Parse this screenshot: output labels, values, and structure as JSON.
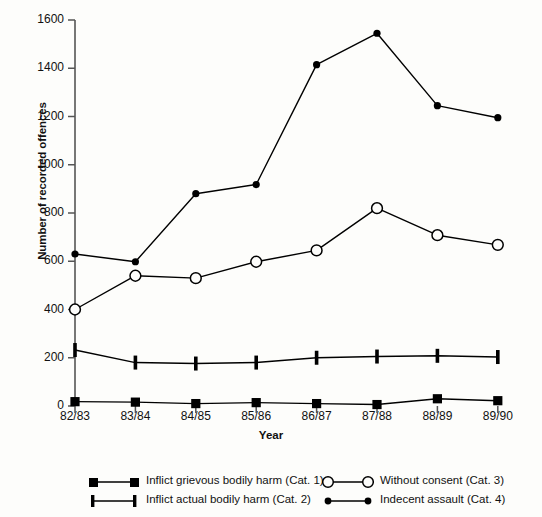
{
  "chart_data": {
    "type": "line",
    "title": "",
    "xlabel": "Year",
    "ylabel": "Number of recorded offences",
    "categories": [
      "82/83",
      "83/84",
      "84/85",
      "85/86",
      "86/87",
      "87/88",
      "88/89",
      "89/90"
    ],
    "ylim": [
      0,
      1600
    ],
    "ytick_values": [
      0,
      200,
      400,
      600,
      800,
      1000,
      1200,
      1400,
      1600
    ],
    "ytick_labels": [
      "0",
      "200",
      "400",
      "600",
      "800",
      "1000",
      "1200",
      "1400",
      "1600"
    ],
    "grid": false,
    "legend_position": "bottom",
    "series": [
      {
        "name": "Inflict grievous bodily harm (Cat. 1)",
        "marker": "filled-square",
        "color": "#000000",
        "values": [
          18,
          16,
          10,
          14,
          10,
          6,
          30,
          22
        ]
      },
      {
        "name": "Inflict actual bodily harm (Cat. 2)",
        "marker": "vertical-bar",
        "color": "#000000",
        "values": [
          232,
          180,
          176,
          180,
          200,
          205,
          208,
          203
        ]
      },
      {
        "name": "Without consent (Cat. 3)",
        "marker": "open-circle",
        "color": "#000000",
        "values": [
          400,
          540,
          530,
          598,
          645,
          820,
          708,
          668
        ]
      },
      {
        "name": "Indecent assault (Cat. 4)",
        "marker": "filled-circle",
        "color": "#000000",
        "values": [
          630,
          598,
          880,
          918,
          1415,
          1545,
          1245,
          1195
        ]
      }
    ]
  },
  "legend": {
    "entries": [
      {
        "label": "Inflict grievous bodily harm (Cat. 1)",
        "marker": "filled-square"
      },
      {
        "label": "Inflict actual bodily harm (Cat. 2)",
        "marker": "vertical-bar"
      },
      {
        "label": "Without consent (Cat. 3)",
        "marker": "open-circle"
      },
      {
        "label": "Indecent assault (Cat. 4)",
        "marker": "filled-circle"
      }
    ]
  }
}
